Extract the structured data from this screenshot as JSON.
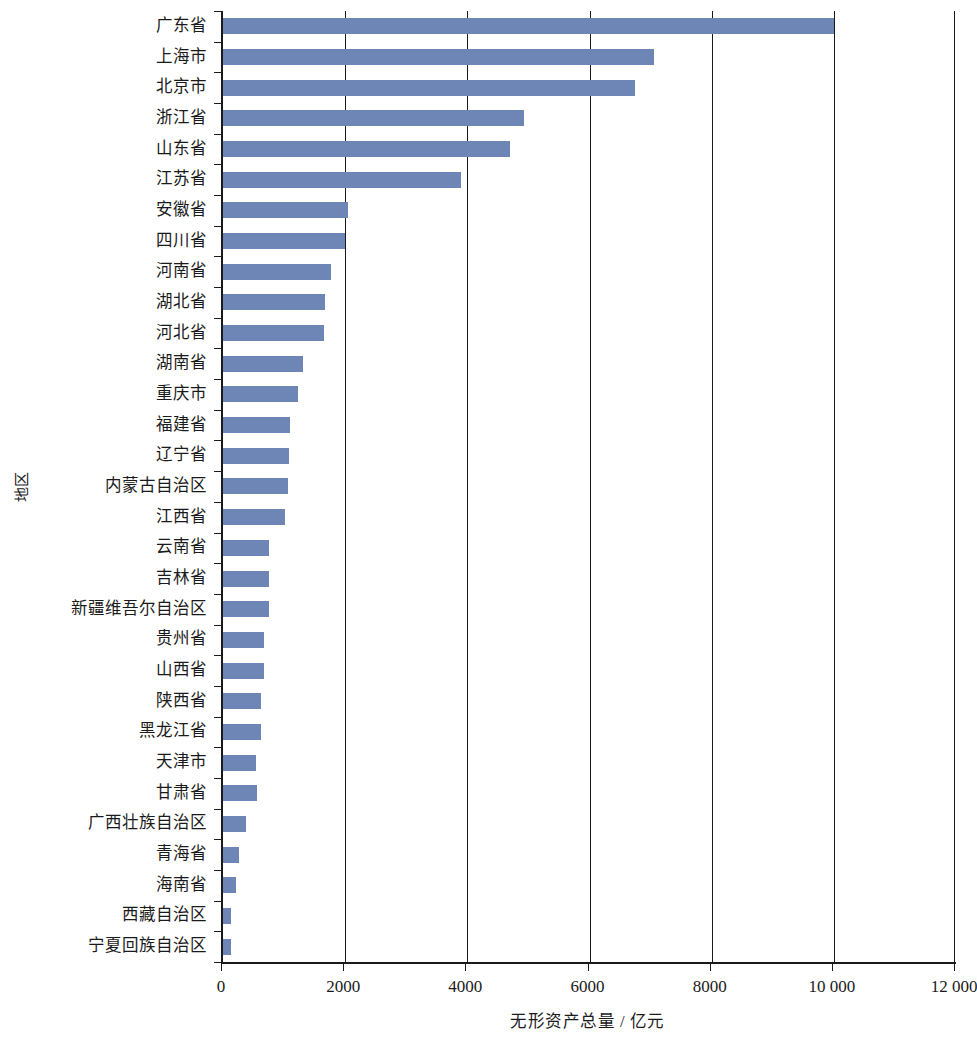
{
  "chart_data": {
    "type": "bar",
    "orientation": "horizontal",
    "title": "",
    "xlabel": "无形资产总量 / 亿元",
    "ylabel": "地区",
    "xlim": [
      0,
      12000
    ],
    "xticks": [
      0,
      2000,
      4000,
      6000,
      8000,
      10000,
      12000
    ],
    "xtick_labels": [
      "0",
      "2000",
      "4000",
      "6000",
      "8000",
      "10 000",
      "12 000"
    ],
    "grid": true,
    "grid_axis": "x",
    "legend": false,
    "bar_color": "#6e86b6",
    "axis_color": "#1a1a1a",
    "categories": [
      "广东省",
      "上海市",
      "北京市",
      "浙江省",
      "山东省",
      "江苏省",
      "安徽省",
      "四川省",
      "河南省",
      "湖北省",
      "河北省",
      "湖南省",
      "重庆市",
      "福建省",
      "辽宁省",
      "内蒙古自治区",
      "江西省",
      "云南省",
      "吉林省",
      "新疆维吾尔自治区",
      "贵州省",
      "山西省",
      "陕西省",
      "黑龙江省",
      "天津市",
      "甘肃省",
      "广西壮族自治区",
      "青海省",
      "海南省",
      "西藏自治区",
      "宁夏回族自治区"
    ],
    "values": [
      10000,
      7050,
      6745,
      4925,
      4700,
      3900,
      2050,
      2000,
      1770,
      1665,
      1650,
      1305,
      1230,
      1100,
      1085,
      1070,
      1015,
      760,
      755,
      760,
      670,
      667,
      630,
      625,
      545,
      550,
      380,
      265,
      215,
      135,
      125
    ]
  }
}
